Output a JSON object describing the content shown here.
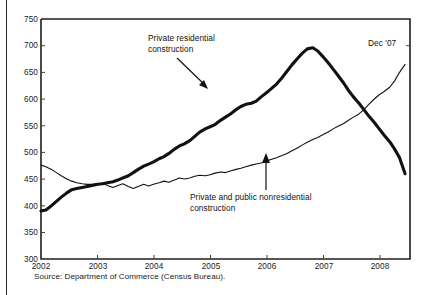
{
  "figure": {
    "source_note": "Source: Department of Commerce (Census Bureau).",
    "partial_top_text": " "
  },
  "annotations": {
    "residential_line1": "Private residential",
    "residential_line2": "construction",
    "nonresidential_line1": "Private and public nonresidential",
    "nonresidential_line2": "construction",
    "endpoint_label": "Dec '07"
  },
  "axes": {
    "y_ticks": [
      "750",
      "700",
      "650",
      "600",
      "550",
      "500",
      "450",
      "400",
      "350",
      "300"
    ],
    "x_ticks": [
      "2002",
      "2003",
      "2004",
      "2005",
      "2006",
      "2007",
      "2008"
    ]
  },
  "chart_data": {
    "type": "line",
    "title": "",
    "subtitle": "",
    "xlabel": "",
    "ylabel": "",
    "xlim": [
      2002.0,
      2008.0
    ],
    "ylim": [
      300,
      750
    ],
    "grid": false,
    "legend_position": "inline-annotations",
    "y_tick_values": [
      300,
      350,
      400,
      450,
      500,
      550,
      600,
      650,
      700,
      750
    ],
    "x_tick_values": [
      2002,
      2003,
      2004,
      2005,
      2006,
      2007,
      2008
    ],
    "units_note": "billions of dollars, seasonally adjusted annual rate",
    "series": [
      {
        "name": "Private residential construction",
        "style": "thick",
        "color": "#111111",
        "x": [
          2002.0,
          2002.08,
          2002.17,
          2002.25,
          2002.33,
          2002.42,
          2002.5,
          2002.58,
          2002.67,
          2002.75,
          2002.83,
          2002.92,
          2003.0,
          2003.08,
          2003.17,
          2003.25,
          2003.33,
          2003.42,
          2003.5,
          2003.58,
          2003.67,
          2003.75,
          2003.83,
          2003.92,
          2004.0,
          2004.08,
          2004.17,
          2004.25,
          2004.33,
          2004.42,
          2004.5,
          2004.58,
          2004.67,
          2004.75,
          2004.83,
          2004.92,
          2005.0,
          2005.08,
          2005.17,
          2005.25,
          2005.33,
          2005.42,
          2005.5,
          2005.58,
          2005.67,
          2005.75,
          2005.83,
          2005.92,
          2006.0,
          2006.08,
          2006.17,
          2006.25,
          2006.33,
          2006.42,
          2006.5,
          2006.58,
          2006.67,
          2006.75,
          2006.83,
          2006.92,
          2007.0,
          2007.08,
          2007.17,
          2007.25,
          2007.33,
          2007.42,
          2007.5,
          2007.58,
          2007.67,
          2007.75,
          2007.83,
          2007.92
        ],
        "values": [
          390,
          392,
          400,
          408,
          416,
          424,
          430,
          432,
          434,
          436,
          438,
          440,
          441,
          443,
          445,
          448,
          452,
          456,
          462,
          468,
          474,
          478,
          482,
          488,
          492,
          498,
          506,
          512,
          516,
          522,
          530,
          538,
          544,
          548,
          552,
          560,
          566,
          572,
          580,
          586,
          590,
          592,
          596,
          604,
          612,
          620,
          628,
          640,
          652,
          664,
          676,
          686,
          694,
          696,
          690,
          680,
          668,
          656,
          644,
          630,
          616,
          604,
          592,
          580,
          568,
          556,
          544,
          532,
          520,
          506,
          490,
          460
        ]
      },
      {
        "name": "Private and public nonresidential construction",
        "style": "thin",
        "color": "#111111",
        "x": [
          2002.0,
          2002.08,
          2002.17,
          2002.25,
          2002.33,
          2002.42,
          2002.5,
          2002.58,
          2002.67,
          2002.75,
          2002.83,
          2002.92,
          2003.0,
          2003.08,
          2003.17,
          2003.25,
          2003.33,
          2003.42,
          2003.5,
          2003.58,
          2003.67,
          2003.75,
          2003.83,
          2003.92,
          2004.0,
          2004.08,
          2004.17,
          2004.25,
          2004.33,
          2004.42,
          2004.5,
          2004.58,
          2004.67,
          2004.75,
          2004.83,
          2004.92,
          2005.0,
          2005.08,
          2005.17,
          2005.25,
          2005.33,
          2005.42,
          2005.5,
          2005.58,
          2005.67,
          2005.75,
          2005.83,
          2005.92,
          2006.0,
          2006.08,
          2006.17,
          2006.25,
          2006.33,
          2006.42,
          2006.5,
          2006.58,
          2006.67,
          2006.75,
          2006.83,
          2006.92,
          2007.0,
          2007.08,
          2007.17,
          2007.25,
          2007.33,
          2007.42,
          2007.5,
          2007.58,
          2007.67,
          2007.75,
          2007.83,
          2007.92
        ],
        "values": [
          476,
          473,
          468,
          462,
          456,
          450,
          446,
          443,
          441,
          440,
          440,
          441,
          442,
          438,
          434,
          438,
          441,
          436,
          432,
          436,
          440,
          437,
          440,
          443,
          446,
          444,
          448,
          452,
          450,
          452,
          455,
          457,
          456,
          458,
          461,
          463,
          462,
          465,
          468,
          470,
          473,
          476,
          478,
          480,
          484,
          487,
          490,
          494,
          498,
          503,
          508,
          514,
          519,
          524,
          528,
          533,
          538,
          544,
          549,
          554,
          560,
          566,
          572,
          580,
          590,
          600,
          608,
          614,
          622,
          634,
          650,
          665
        ]
      }
    ],
    "annotations": [
      {
        "text": "Private residential construction",
        "x": 2004.55,
        "y": 712,
        "arrow_to": {
          "x": 2005.4,
          "y": 615
        }
      },
      {
        "text": "Private and public nonresidential construction",
        "x": 2004.6,
        "y": 372,
        "arrow_to": {
          "x": 2005.6,
          "y": 472
        }
      },
      {
        "text": "Dec '07",
        "x": 2007.55,
        "y": 706
      }
    ]
  }
}
